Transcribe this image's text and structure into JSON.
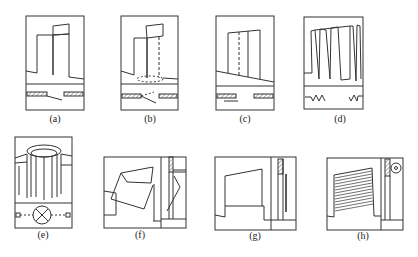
{
  "figure": {
    "panels": [
      {
        "id": "a",
        "label": "(a)",
        "x": 55,
        "y": 117,
        "desc": "swing door"
      },
      {
        "id": "b",
        "label": "(b)",
        "x": 150,
        "y": 117,
        "desc": "spring door"
      },
      {
        "id": "c",
        "label": "(c)",
        "x": 245,
        "y": 117,
        "desc": "sliding door"
      },
      {
        "id": "d",
        "label": "(d)",
        "x": 340,
        "y": 117,
        "desc": "folding door"
      },
      {
        "id": "e",
        "label": "(e)",
        "x": 43,
        "y": 232,
        "desc": "revolving door"
      },
      {
        "id": "f",
        "label": "(f)",
        "x": 140,
        "y": 232,
        "desc": "flap up door"
      },
      {
        "id": "g",
        "label": "(g)",
        "x": 255,
        "y": 233,
        "desc": "lift door"
      },
      {
        "id": "h",
        "label": "(h)",
        "x": 363,
        "y": 233,
        "desc": "rolling shutter door"
      }
    ],
    "stroke_color": "#333333"
  }
}
